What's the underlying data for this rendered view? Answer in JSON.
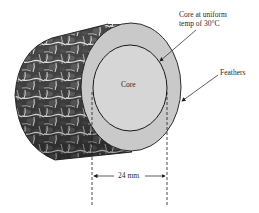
{
  "diagram": {
    "labels": {
      "core_temp_line1": "Core at uniform",
      "core_temp_line2": "temp of 30°C",
      "feathers": "Feathers",
      "core": "Core",
      "dimension": "24 mm"
    },
    "colors": {
      "outline": "#1a1a1a",
      "feather_face": "#c8c8c8",
      "core_face": "#d4d4d4",
      "body_dark": "#3a3a3a",
      "body_light": "#e8e8e8"
    }
  }
}
